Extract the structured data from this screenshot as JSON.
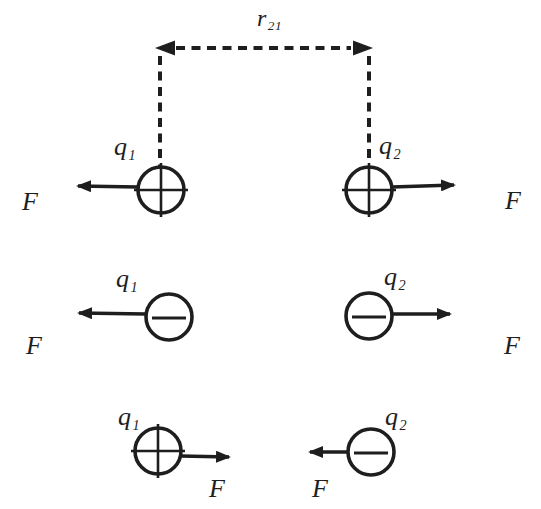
{
  "diagram": {
    "background_color": "#ffffff",
    "ink_color": "#1e1e1e",
    "distance_marker": {
      "symbol": "r",
      "subscript": "21",
      "style": "dashed-double-arrow"
    },
    "rows": [
      {
        "left_charge": {
          "symbol": "q",
          "subscript": "1",
          "polarity": "positive",
          "polarity_icon": "plus-icon",
          "force_label": "F",
          "force_direction": "left"
        },
        "right_charge": {
          "symbol": "q",
          "subscript": "2",
          "polarity": "positive",
          "polarity_icon": "plus-icon",
          "force_label": "F",
          "force_direction": "right"
        }
      },
      {
        "left_charge": {
          "symbol": "q",
          "subscript": "1",
          "polarity": "negative",
          "polarity_icon": "minus-icon",
          "force_label": "F",
          "force_direction": "left"
        },
        "right_charge": {
          "symbol": "q",
          "subscript": "2",
          "polarity": "negative",
          "polarity_icon": "minus-icon",
          "force_label": "F",
          "force_direction": "right"
        }
      },
      {
        "left_charge": {
          "symbol": "q",
          "subscript": "1",
          "polarity": "positive",
          "polarity_icon": "plus-icon",
          "force_label": "F",
          "force_direction": "right"
        },
        "right_charge": {
          "symbol": "q",
          "subscript": "2",
          "polarity": "negative",
          "polarity_icon": "minus-icon",
          "force_label": "F",
          "force_direction": "left"
        }
      }
    ]
  }
}
